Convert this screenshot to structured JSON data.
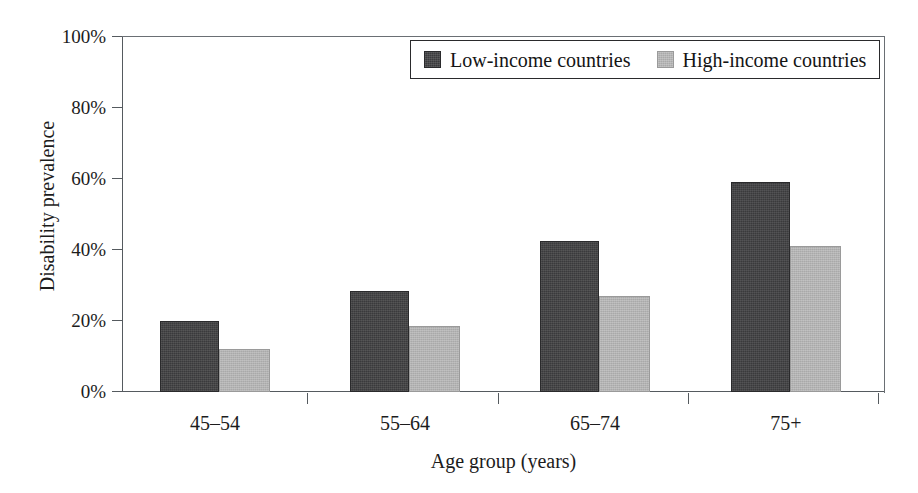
{
  "chart_data": {
    "type": "bar",
    "title": "",
    "xlabel": "Age group (years)",
    "ylabel": "Disability prevalence",
    "categories": [
      "45–54",
      "55–64",
      "65–74",
      "75+"
    ],
    "series": [
      {
        "name": "Low-income countries",
        "color": "#3a3a3c",
        "values": [
          20,
          28.5,
          42.5,
          59
        ]
      },
      {
        "name": "High-income countries",
        "color": "#a9a9a9",
        "values": [
          12,
          18.5,
          27,
          41
        ]
      }
    ],
    "ylim": [
      0,
      100
    ],
    "yticks": [
      0,
      20,
      40,
      60,
      80,
      100
    ],
    "ytick_labels": [
      "0%",
      "20%",
      "40%",
      "60%",
      "80%",
      "100%"
    ],
    "grid": false,
    "legend_position": "top-center"
  },
  "legend": {
    "entries": [
      {
        "label": "Low-income countries"
      },
      {
        "label": "High-income countries"
      }
    ]
  },
  "axes": {
    "y_title": "Disability prevalence",
    "x_title": "Age group (years)",
    "y_tick_labels": [
      "100%",
      "80%",
      "60%",
      "40%",
      "20%",
      "0%"
    ],
    "x_tick_labels": [
      "45–54",
      "55–64",
      "65–74",
      "75+"
    ]
  },
  "colors": {
    "low_income": "#3a3a3c",
    "high_income": "#a9a9a9",
    "axis": "#555a5f",
    "text": "#1c1c1c",
    "background": "#ffffff"
  }
}
